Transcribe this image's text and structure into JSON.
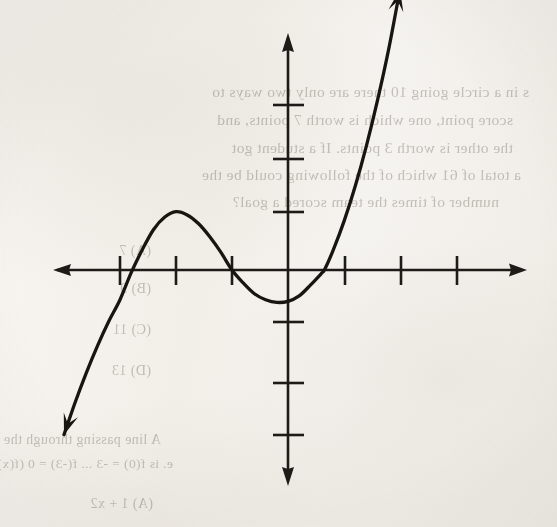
{
  "page": {
    "kind": "scanned-textbook-page",
    "background_color": "#f4f2ee",
    "ink_color": "#17150f",
    "width": 557,
    "height": 527
  },
  "figure": {
    "name": "cubic-function-graph",
    "axis_color": "#1d1b18",
    "curve_color": "#17150f",
    "origin_px": {
      "x": 288,
      "y": 270
    },
    "unit_px": {
      "x": 56,
      "y": 54
    },
    "x_axis": {
      "left_end_px": 53,
      "right_end_px": 527,
      "arrowheads": "both"
    },
    "y_axis": {
      "top_end_px": 33,
      "bottom_end_px": 486,
      "arrowheads": "both"
    },
    "x_ticks_units": [
      -3,
      -2,
      -1,
      1,
      2,
      3,
      4
    ],
    "y_ticks_units": [
      3,
      2,
      1,
      -1,
      -2,
      -3
    ],
    "tick_half_length_px": {
      "x": 14,
      "y": 15
    }
  },
  "chart_data": {
    "type": "line",
    "title": "",
    "xlabel": "",
    "ylabel": "",
    "xlim": [
      -4.2,
      4.3
    ],
    "ylim": [
      -4.4,
      4.4
    ],
    "grid": false,
    "legend": false,
    "axes_style": "cartesian-arrows",
    "x_tick_labels": [
      "-3",
      "-2",
      "-1",
      "1",
      "2",
      "3",
      "4"
    ],
    "y_tick_labels": [
      "3",
      "2",
      "1",
      "-1",
      "-2",
      "-3"
    ],
    "tick_labels_visible": false,
    "series": [
      {
        "name": "cubic",
        "description": "Cubic polynomial with three real roots, rising to the right",
        "x_intercepts": [
          -3.0,
          -1.0,
          0.65
        ],
        "local_maximum": {
          "x": -2.0,
          "y": 1.08
        },
        "local_minimum": {
          "x": 0.0,
          "y": -0.58
        },
        "end_behavior": {
          "left": "falls",
          "right": "rises"
        },
        "visible_x_range": [
          -4.0,
          2.05
        ],
        "x": [
          -4.0,
          -3.8,
          -3.6,
          -3.4,
          -3.2,
          -3.0,
          -2.8,
          -2.6,
          -2.4,
          -2.2,
          -2.0,
          -1.8,
          -1.6,
          -1.4,
          -1.2,
          -1.0,
          -0.8,
          -0.6,
          -0.4,
          -0.2,
          0.0,
          0.2,
          0.4,
          0.6,
          0.65,
          0.8,
          1.0,
          1.2,
          1.4,
          1.6,
          1.8,
          2.0
        ],
        "y": [
          -3.05,
          -2.45,
          -1.9,
          -1.4,
          -0.95,
          -0.55,
          -0.05,
          0.38,
          0.75,
          0.98,
          1.08,
          1.02,
          0.86,
          0.62,
          0.33,
          0.0,
          -0.24,
          -0.44,
          -0.55,
          -0.6,
          -0.58,
          -0.48,
          -0.28,
          -0.06,
          0.0,
          0.35,
          0.9,
          1.55,
          2.3,
          3.15,
          4.1,
          5.2
        ]
      }
    ]
  },
  "bleed_text": {
    "note": "Faint mirrored text showing through from the reverse of the page",
    "lines": [
      {
        "text": "s in a circle going 10 there are only two ways to",
        "x": 28,
        "y": 83,
        "size": 15.5
      },
      {
        "text": "score point, one which is worth 7 points, and",
        "x": 44,
        "y": 111,
        "size": 15.5
      },
      {
        "text": "the other is worth 3 points. If a student got",
        "x": 44,
        "y": 139,
        "size": 15.5
      },
      {
        "text": "a total of 61 which of the following could be the",
        "x": 36,
        "y": 166,
        "size": 15.5
      },
      {
        "text": "number of times the team scored a goal?",
        "x": 58,
        "y": 193,
        "size": 15.5
      },
      {
        "text": "(A) 7",
        "x": 406,
        "y": 243,
        "size": 14
      },
      {
        "text": "(B) 9",
        "x": 406,
        "y": 281,
        "size": 14
      },
      {
        "text": "(C) 11",
        "x": 406,
        "y": 322,
        "size": 14
      },
      {
        "text": "(D) 13",
        "x": 406,
        "y": 363,
        "size": 14
      },
      {
        "text": "A line passing through the points",
        "x": 396,
        "y": 432,
        "size": 14
      },
      {
        "text": "e. is f(0) = -3 ... f(-3) = 0 (f(x)) = -12",
        "x": 384,
        "y": 456,
        "size": 13.5
      },
      {
        "text": "(A) 1 + x2",
        "x": 404,
        "y": 496,
        "size": 14
      }
    ]
  }
}
